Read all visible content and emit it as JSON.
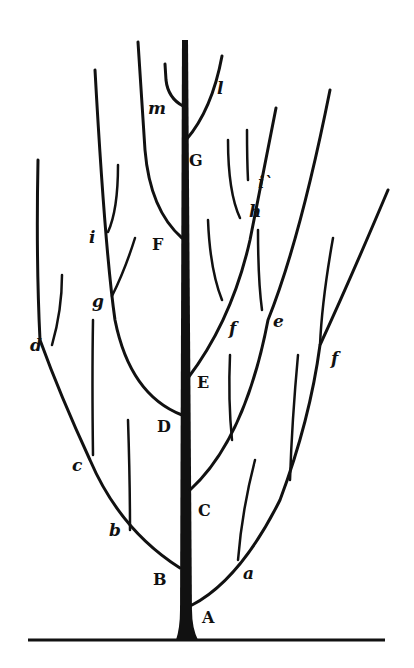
{
  "diagram": {
    "type": "tree-pruning-diagram",
    "colors": {
      "ink": "#111111",
      "background": "#ffffff"
    },
    "trunk_labels": [
      {
        "id": "A",
        "text": "A",
        "x": 202,
        "y": 610
      },
      {
        "id": "B",
        "text": "B",
        "x": 153,
        "y": 572
      },
      {
        "id": "C",
        "text": "C",
        "x": 198,
        "y": 503
      },
      {
        "id": "D",
        "text": "D",
        "x": 157,
        "y": 419
      },
      {
        "id": "E",
        "text": "E",
        "x": 197,
        "y": 375
      },
      {
        "id": "F",
        "text": "F",
        "x": 152,
        "y": 237
      },
      {
        "id": "G",
        "text": "G",
        "x": 189,
        "y": 153
      }
    ],
    "branch_labels": [
      {
        "id": "a",
        "text": "a",
        "x": 243,
        "y": 568
      },
      {
        "id": "b",
        "text": "b",
        "x": 109,
        "y": 524
      },
      {
        "id": "c",
        "text": "c",
        "x": 72,
        "y": 459
      },
      {
        "id": "d",
        "text": "d",
        "x": 30,
        "y": 339
      },
      {
        "id": "e",
        "text": "e",
        "x": 273,
        "y": 315
      },
      {
        "id": "f_left",
        "text": "f",
        "x": 229,
        "y": 322
      },
      {
        "id": "f_right",
        "text": "f",
        "x": 331,
        "y": 352
      },
      {
        "id": "g",
        "text": "g",
        "x": 92,
        "y": 295
      },
      {
        "id": "h",
        "text": "h",
        "x": 249,
        "y": 205
      },
      {
        "id": "i_left",
        "text": "i",
        "x": 89,
        "y": 231
      },
      {
        "id": "i_right",
        "text": "i`",
        "x": 258,
        "y": 176
      },
      {
        "id": "l",
        "text": "l",
        "x": 217,
        "y": 82
      },
      {
        "id": "m",
        "text": "m",
        "x": 148,
        "y": 102
      }
    ]
  }
}
